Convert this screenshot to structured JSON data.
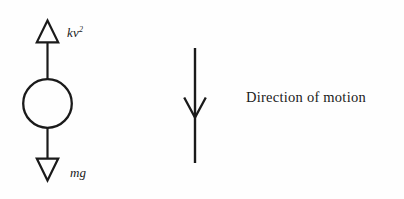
{
  "figure": {
    "width": 404,
    "height": 199,
    "background_color": "#fefefe",
    "ink_color": "#1a1a1a"
  },
  "labels": {
    "drag_force": "kv",
    "drag_force_exponent": "2",
    "weight_force": "mg",
    "direction": "Direction of motion"
  },
  "diagram": {
    "body": {
      "shape": "circle",
      "filled": false,
      "center_x": 47.5,
      "center_y": 103.5,
      "radius": 24.5,
      "stroke_width": 2.2
    },
    "arrows": [
      {
        "name": "drag-force-arrow",
        "label": "kv2",
        "direction": "up",
        "head_style": "open-triangle",
        "tail_x": 47.5,
        "tail_y": 79,
        "tip_x": 47.5,
        "tip_y": 20,
        "head_width": 20,
        "head_length": 22
      },
      {
        "name": "weight-force-arrow",
        "label": "mg",
        "direction": "down",
        "head_style": "open-triangle",
        "tail_x": 47.5,
        "tail_y": 128,
        "tip_x": 47.5,
        "tip_y": 180,
        "head_width": 20,
        "head_length": 22
      },
      {
        "name": "motion-direction-arrow",
        "label": "Direction of motion",
        "direction": "down",
        "head_style": "open-barb",
        "tail_x": 195,
        "tail_y": 48,
        "tip_x": 195,
        "tip_y": 163,
        "barb_y_tip": 117,
        "barb_left_x": 184,
        "barb_right_x": 206,
        "barb_top_y": 97
      }
    ]
  }
}
